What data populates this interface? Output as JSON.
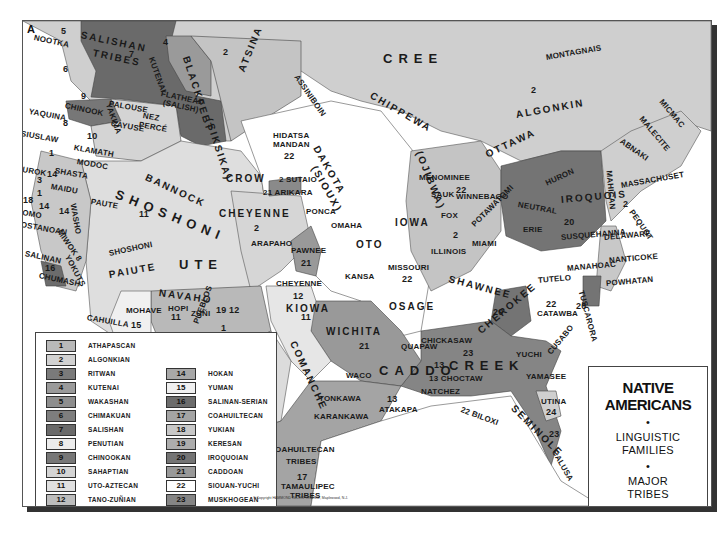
{
  "map": {
    "corner_label": "A",
    "title": {
      "line1": "NATIVE",
      "line2": "AMERICANS",
      "bullet": "•",
      "line3": "LINGUISTIC",
      "line4": "FAMILIES",
      "line5": "MAJOR",
      "line6": "TRIBES"
    },
    "copyright": "© Copyright HAMMOND INCORPORATED, Maplewood, N.J.",
    "colors": {
      "light": "#d6d6d6",
      "mid": "#b4b4b4",
      "dark": "#8c8c8c",
      "darker": "#6e6e6e",
      "white": "#ffffff",
      "border": "#444444"
    }
  },
  "legend": {
    "families": [
      {
        "num": "1",
        "name": "ATHAPASCAN",
        "color": "#b9b9b9"
      },
      {
        "num": "2",
        "name": "ALGONKIAN",
        "color": "#d2d2d2"
      },
      {
        "num": "3",
        "name": "RITWAN",
        "color": "#7a7a7a"
      },
      {
        "num": "4",
        "name": "KUTENAI",
        "color": "#9a9a9a"
      },
      {
        "num": "5",
        "name": "WAKASHAN",
        "color": "#8e8e8e"
      },
      {
        "num": "6",
        "name": "CHIMAKUAN",
        "color": "#7e7e7e"
      },
      {
        "num": "7",
        "name": "SALISHAN",
        "color": "#6a6a6a"
      },
      {
        "num": "8",
        "name": "PENUTIAN",
        "color": "#ececec"
      },
      {
        "num": "9",
        "name": "CHINOOKAN",
        "color": "#777777"
      },
      {
        "num": "10",
        "name": "SAHAPTIAN",
        "color": "#d4d4d4"
      },
      {
        "num": "11",
        "name": "UTO-AZTECAN",
        "color": "#e0e0e0"
      },
      {
        "num": "12",
        "name": "TANO-ZUÑIAN",
        "color": "#bdbdbd"
      },
      {
        "num": "13",
        "name": "TUNICAN",
        "color": "#a0a0a0"
      },
      {
        "num": "14",
        "name": "HOKAN",
        "color": "#a8a8a8"
      },
      {
        "num": "15",
        "name": "YUMAN",
        "color": "#f0f0f0"
      },
      {
        "num": "16",
        "name": "SALINAN-SERIAN",
        "color": "#6c6c6c"
      },
      {
        "num": "17",
        "name": "COAHUILTECAN",
        "color": "#a4a4a4"
      },
      {
        "num": "18",
        "name": "YUKIAN",
        "color": "#c8c8c8"
      },
      {
        "num": "19",
        "name": "KERESAN",
        "color": "#adadad"
      },
      {
        "num": "20",
        "name": "IROQUOIAN",
        "color": "#747474"
      },
      {
        "num": "21",
        "name": "CADDOAN",
        "color": "#999999"
      },
      {
        "num": "22",
        "name": "SIOUAN-YUCHI",
        "color": "#ffffff"
      },
      {
        "num": "23",
        "name": "MUSKHOGEAN",
        "color": "#858585"
      },
      {
        "num": "24",
        "name": "TIMUCUAN",
        "color": "#cfcfcf"
      }
    ]
  },
  "labels": [
    {
      "text": "SALISHAN",
      "x": 80,
      "y": 28,
      "cls": "med",
      "rot": 12
    },
    {
      "text": "TRIBES",
      "x": 92,
      "y": 46,
      "cls": "med",
      "rot": 12
    },
    {
      "text": "7",
      "x": 128,
      "y": 48,
      "cls": "num",
      "rot": 0
    },
    {
      "text": "5",
      "x": 60,
      "y": 25,
      "cls": "num",
      "rot": 0
    },
    {
      "text": "NOOTKA",
      "x": 33,
      "y": 32,
      "cls": "",
      "rot": 12
    },
    {
      "text": "6",
      "x": 62,
      "y": 63,
      "cls": "num",
      "rot": 0
    },
    {
      "text": "KUTENAI",
      "x": 150,
      "y": 52,
      "cls": "",
      "rot": 70
    },
    {
      "text": "4",
      "x": 162,
      "y": 36,
      "cls": "num",
      "rot": 0
    },
    {
      "text": "BLACKFEET",
      "x": 185,
      "y": 50,
      "cls": "med",
      "rot": 72
    },
    {
      "text": "(SIKSIKA)",
      "x": 208,
      "y": 112,
      "cls": "med",
      "rot": 72
    },
    {
      "text": "2",
      "x": 222,
      "y": 46,
      "cls": "num",
      "rot": 0
    },
    {
      "text": "ATSINA",
      "x": 240,
      "y": 65,
      "cls": "med",
      "rot": -68
    },
    {
      "text": "ASSINIBOIN",
      "x": 295,
      "y": 70,
      "cls": "",
      "rot": 55
    },
    {
      "text": "FLATHEAD",
      "x": 160,
      "y": 88,
      "cls": "",
      "rot": 12
    },
    {
      "text": "(SALISH)",
      "x": 162,
      "y": 97,
      "cls": "",
      "rot": 12
    },
    {
      "text": "9",
      "x": 80,
      "y": 90,
      "cls": "num",
      "rot": 0
    },
    {
      "text": "CHINOOK",
      "x": 64,
      "y": 100,
      "cls": "",
      "rot": 12
    },
    {
      "text": "YAKIMA",
      "x": 107,
      "y": 98,
      "cls": "",
      "rot": 70
    },
    {
      "text": "PALOUSE",
      "x": 108,
      "y": 98,
      "cls": "",
      "rot": 10
    },
    {
      "text": "NEZ",
      "x": 142,
      "y": 110,
      "cls": "",
      "rot": 10
    },
    {
      "text": "PERCÉ",
      "x": 138,
      "y": 119,
      "cls": "",
      "rot": 10
    },
    {
      "text": "CAYUSE",
      "x": 110,
      "y": 118,
      "cls": "",
      "rot": 10
    },
    {
      "text": "YAQUINA",
      "x": 28,
      "y": 106,
      "cls": "",
      "rot": 10
    },
    {
      "text": "8",
      "x": 62,
      "y": 117,
      "cls": "num",
      "rot": 0
    },
    {
      "text": "SIUSLAW",
      "x": 20,
      "y": 128,
      "cls": "",
      "rot": 10
    },
    {
      "text": "10",
      "x": 86,
      "y": 130,
      "cls": "num",
      "rot": 0
    },
    {
      "text": "KLAMATH",
      "x": 73,
      "y": 142,
      "cls": "",
      "rot": 10
    },
    {
      "text": "MODOC",
      "x": 76,
      "y": 156,
      "cls": "",
      "rot": 10
    },
    {
      "text": "1",
      "x": 48,
      "y": 147,
      "cls": "num",
      "rot": 0
    },
    {
      "text": "YUROK",
      "x": 16,
      "y": 163,
      "cls": "",
      "rot": 10
    },
    {
      "text": "14",
      "x": 46,
      "y": 168,
      "cls": "num",
      "rot": 0
    },
    {
      "text": "SHASTA",
      "x": 54,
      "y": 165,
      "cls": "",
      "rot": 10
    },
    {
      "text": "3",
      "x": 36,
      "y": 174,
      "cls": "num",
      "rot": 0
    },
    {
      "text": "MAIDU",
      "x": 50,
      "y": 181,
      "cls": "",
      "rot": 10
    },
    {
      "text": "1",
      "x": 36,
      "y": 187,
      "cls": "num",
      "rot": 0
    },
    {
      "text": "18",
      "x": 22,
      "y": 194,
      "cls": "num",
      "rot": 0
    },
    {
      "text": "14",
      "x": 38,
      "y": 200,
      "cls": "num",
      "rot": 0
    },
    {
      "text": "POMO",
      "x": 16,
      "y": 206,
      "cls": "",
      "rot": 10
    },
    {
      "text": "COSTANOAN",
      "x": 14,
      "y": 218,
      "cls": "",
      "rot": 10
    },
    {
      "text": "WASHO",
      "x": 72,
      "y": 198,
      "cls": "",
      "rot": 80
    },
    {
      "text": "14",
      "x": 58,
      "y": 205,
      "cls": "num",
      "rot": 0
    },
    {
      "text": "MIWOK 8",
      "x": 58,
      "y": 225,
      "cls": "",
      "rot": 55
    },
    {
      "text": "YOKUTS",
      "x": 66,
      "y": 250,
      "cls": "",
      "rot": 62
    },
    {
      "text": "SALINAN",
      "x": 24,
      "y": 248,
      "cls": "",
      "rot": 12
    },
    {
      "text": "16",
      "x": 44,
      "y": 262,
      "cls": "num",
      "rot": 0
    },
    {
      "text": "CHUMASH",
      "x": 38,
      "y": 270,
      "cls": "",
      "rot": 12
    },
    {
      "text": "BANNOCK",
      "x": 145,
      "y": 170,
      "cls": "med",
      "rot": 25
    },
    {
      "text": "SHOSHONI",
      "x": 115,
      "y": 185,
      "cls": "big",
      "rot": 22
    },
    {
      "text": "PAUTE",
      "x": 90,
      "y": 196,
      "cls": "",
      "rot": 10
    },
    {
      "text": "11",
      "x": 138,
      "y": 208,
      "cls": "num",
      "rot": 0
    },
    {
      "text": "CROW",
      "x": 225,
      "y": 172,
      "cls": "med",
      "rot": 0
    },
    {
      "text": "CHEYENNE",
      "x": 218,
      "y": 207,
      "cls": "med",
      "rot": 0
    },
    {
      "text": "2",
      "x": 253,
      "y": 222,
      "cls": "num",
      "rot": 0
    },
    {
      "text": "ARAPAHO",
      "x": 250,
      "y": 238,
      "cls": "",
      "rot": 0
    },
    {
      "text": "SHOSHONI",
      "x": 108,
      "y": 248,
      "cls": "",
      "rot": -12
    },
    {
      "text": "UTE",
      "x": 178,
      "y": 256,
      "cls": "big",
      "rot": 0
    },
    {
      "text": "PAIUTE",
      "x": 108,
      "y": 268,
      "cls": "med",
      "rot": -10
    },
    {
      "text": "HIDATSA",
      "x": 272,
      "y": 130,
      "cls": "",
      "rot": 0
    },
    {
      "text": "MANDAN",
      "x": 272,
      "y": 139,
      "cls": "",
      "rot": 0
    },
    {
      "text": "22",
      "x": 283,
      "y": 150,
      "cls": "num",
      "rot": 0
    },
    {
      "text": "DAKOTA",
      "x": 315,
      "y": 140,
      "cls": "med",
      "rot": 60
    },
    {
      "text": "(SIOUX)",
      "x": 313,
      "y": 160,
      "cls": "med",
      "rot": 60
    },
    {
      "text": "2 SUTAIO",
      "x": 278,
      "y": 174,
      "cls": "",
      "rot": 0
    },
    {
      "text": "21 ARIKARA",
      "x": 262,
      "y": 187,
      "cls": "",
      "rot": 0
    },
    {
      "text": "CREE",
      "x": 382,
      "y": 50,
      "cls": "big",
      "rot": 0
    },
    {
      "text": "CHIPPEWA",
      "x": 370,
      "y": 88,
      "cls": "med",
      "rot": 30
    },
    {
      "text": "(OJIBWA)",
      "x": 418,
      "y": 145,
      "cls": "med",
      "rot": 68
    },
    {
      "text": "MONTAGNAIS",
      "x": 545,
      "y": 52,
      "cls": "",
      "rot": -10
    },
    {
      "text": "2",
      "x": 530,
      "y": 84,
      "cls": "num",
      "rot": 0
    },
    {
      "text": "ALGONKIN",
      "x": 515,
      "y": 108,
      "cls": "med",
      "rot": -10
    },
    {
      "text": "OTTAWA",
      "x": 485,
      "y": 148,
      "cls": "med",
      "rot": -25
    },
    {
      "text": "MICMAC",
      "x": 660,
      "y": 95,
      "cls": "",
      "rot": 50
    },
    {
      "text": "MALECITE",
      "x": 640,
      "y": 112,
      "cls": "",
      "rot": 50
    },
    {
      "text": "ABNAKI",
      "x": 620,
      "y": 135,
      "cls": "",
      "rot": 35
    },
    {
      "text": "MAHICAN",
      "x": 608,
      "y": 165,
      "cls": "",
      "rot": 85
    },
    {
      "text": "MASSACHUSET",
      "x": 620,
      "y": 180,
      "cls": "",
      "rot": -10
    },
    {
      "text": "2",
      "x": 622,
      "y": 198,
      "cls": "num",
      "rot": 0
    },
    {
      "text": "PEQUOT",
      "x": 630,
      "y": 205,
      "cls": "",
      "rot": 55
    },
    {
      "text": "MENOMINEE",
      "x": 418,
      "y": 172,
      "cls": "",
      "rot": 0
    },
    {
      "text": "SAUK",
      "x": 430,
      "y": 189,
      "cls": "",
      "rot": 0
    },
    {
      "text": "22",
      "x": 455,
      "y": 184,
      "cls": "num",
      "rot": 0
    },
    {
      "text": "WINNEBAGO",
      "x": 455,
      "y": 191,
      "cls": "",
      "rot": 0
    },
    {
      "text": "HURON",
      "x": 545,
      "y": 178,
      "cls": "",
      "rot": -25
    },
    {
      "text": "IROQUOIS",
      "x": 560,
      "y": 193,
      "cls": "med",
      "rot": -5
    },
    {
      "text": "NEUTRAL",
      "x": 517,
      "y": 199,
      "cls": "",
      "rot": 10
    },
    {
      "text": "POTAWATOMI",
      "x": 472,
      "y": 220,
      "cls": "",
      "rot": -45
    },
    {
      "text": "FOX",
      "x": 440,
      "y": 210,
      "cls": "",
      "rot": 0
    },
    {
      "text": "IOWA",
      "x": 394,
      "y": 216,
      "cls": "med",
      "rot": 0
    },
    {
      "text": "2",
      "x": 452,
      "y": 229,
      "cls": "num",
      "rot": 0
    },
    {
      "text": "20",
      "x": 563,
      "y": 216,
      "cls": "num",
      "rot": 0
    },
    {
      "text": "ERIE",
      "x": 522,
      "y": 224,
      "cls": "",
      "rot": 0
    },
    {
      "text": "SUSQUEHANNA",
      "x": 560,
      "y": 232,
      "cls": "",
      "rot": -5
    },
    {
      "text": "DELAWARE",
      "x": 603,
      "y": 232,
      "cls": "",
      "rot": -5
    },
    {
      "text": "PONCA",
      "x": 305,
      "y": 206,
      "cls": "",
      "rot": 0
    },
    {
      "text": "OMAHA",
      "x": 330,
      "y": 220,
      "cls": "",
      "rot": 0
    },
    {
      "text": "OTO",
      "x": 355,
      "y": 238,
      "cls": "med",
      "rot": 0
    },
    {
      "text": "ILLINOIS",
      "x": 430,
      "y": 246,
      "cls": "",
      "rot": 0
    },
    {
      "text": "MIAMI",
      "x": 471,
      "y": 238,
      "cls": "",
      "rot": 0
    },
    {
      "text": "PAWNEE",
      "x": 290,
      "y": 245,
      "cls": "",
      "rot": 0
    },
    {
      "text": "21",
      "x": 300,
      "y": 257,
      "cls": "num",
      "rot": 0
    },
    {
      "text": "MISSOURI",
      "x": 387,
      "y": 262,
      "cls": "",
      "rot": 0
    },
    {
      "text": "22",
      "x": 401,
      "y": 273,
      "cls": "num",
      "rot": 0
    },
    {
      "text": "KANSA",
      "x": 344,
      "y": 271,
      "cls": "",
      "rot": 0
    },
    {
      "text": "SHAWNEE",
      "x": 448,
      "y": 272,
      "cls": "med",
      "rot": 15
    },
    {
      "text": "MANAHOAC",
      "x": 566,
      "y": 263,
      "cls": "",
      "rot": -5
    },
    {
      "text": "TUTELO",
      "x": 537,
      "y": 275,
      "cls": "",
      "rot": -5
    },
    {
      "text": "NANTICOKE",
      "x": 608,
      "y": 255,
      "cls": "",
      "rot": -5
    },
    {
      "text": "POWHATAN",
      "x": 605,
      "y": 278,
      "cls": "",
      "rot": -5
    },
    {
      "text": "TUSCARORA",
      "x": 580,
      "y": 285,
      "cls": "",
      "rot": 75
    },
    {
      "text": "20",
      "x": 575,
      "y": 300,
      "cls": "num",
      "rot": 0
    },
    {
      "text": "22",
      "x": 545,
      "y": 298,
      "cls": "num",
      "rot": 0
    },
    {
      "text": "CATAWBA",
      "x": 536,
      "y": 308,
      "cls": "",
      "rot": 0
    },
    {
      "text": "CHEYENNE",
      "x": 275,
      "y": 278,
      "cls": "",
      "rot": 0
    },
    {
      "text": "12",
      "x": 292,
      "y": 290,
      "cls": "num",
      "rot": 0
    },
    {
      "text": "KIOWA",
      "x": 285,
      "y": 302,
      "cls": "med",
      "rot": 0
    },
    {
      "text": "OSAGE",
      "x": 388,
      "y": 300,
      "cls": "med",
      "rot": 0
    },
    {
      "text": "20",
      "x": 492,
      "y": 306,
      "cls": "num",
      "rot": 0
    },
    {
      "text": "CHEROKEE",
      "x": 478,
      "y": 325,
      "cls": "med",
      "rot": -40
    },
    {
      "text": "NAVAHO",
      "x": 158,
      "y": 286,
      "cls": "med",
      "rot": 8
    },
    {
      "text": "HOPI",
      "x": 167,
      "y": 303,
      "cls": "",
      "rot": 0
    },
    {
      "text": "11",
      "x": 170,
      "y": 311,
      "cls": "num",
      "rot": 0
    },
    {
      "text": "ZUÑI",
      "x": 190,
      "y": 308,
      "cls": "",
      "rot": 0
    },
    {
      "text": "19 12",
      "x": 215,
      "y": 304,
      "cls": "num",
      "rot": 0
    },
    {
      "text": "MOHAVE",
      "x": 125,
      "y": 305,
      "cls": "",
      "rot": 0
    },
    {
      "text": "15",
      "x": 130,
      "y": 319,
      "cls": "num",
      "rot": 0
    },
    {
      "text": "CAHUILLA",
      "x": 86,
      "y": 312,
      "cls": "",
      "rot": 10
    },
    {
      "text": "YUMA",
      "x": 112,
      "y": 330,
      "cls": "med",
      "rot": 10
    },
    {
      "text": "DIEGUEÑO",
      "x": 58,
      "y": 337,
      "cls": "",
      "rot": 10
    },
    {
      "text": "PAPAGO",
      "x": 140,
      "y": 348,
      "cls": "",
      "rot": -10
    },
    {
      "text": "PIMA",
      "x": 148,
      "y": 362,
      "cls": "",
      "rot": 10
    },
    {
      "text": "APACHE",
      "x": 158,
      "y": 328,
      "cls": "big",
      "rot": 25
    },
    {
      "text": "PUEBLOS",
      "x": 195,
      "y": 318,
      "cls": "",
      "rot": -70
    },
    {
      "text": "1",
      "x": 220,
      "y": 322,
      "cls": "num",
      "rot": 0
    },
    {
      "text": "11",
      "x": 300,
      "y": 311,
      "cls": "num",
      "rot": 0
    },
    {
      "text": "COMANCHE",
      "x": 292,
      "y": 335,
      "cls": "med",
      "rot": 65
    },
    {
      "text": "WICHITA",
      "x": 325,
      "y": 325,
      "cls": "med",
      "rot": 0
    },
    {
      "text": "21",
      "x": 358,
      "y": 340,
      "cls": "num",
      "rot": 0
    },
    {
      "text": "QUAPAW",
      "x": 400,
      "y": 341,
      "cls": "",
      "rot": 0
    },
    {
      "text": "CADDO",
      "x": 378,
      "y": 362,
      "cls": "big",
      "rot": 0
    },
    {
      "text": "WACO",
      "x": 345,
      "y": 370,
      "cls": "",
      "rot": 0
    },
    {
      "text": "CHICKASAW",
      "x": 420,
      "y": 335,
      "cls": "",
      "rot": 0
    },
    {
      "text": "23",
      "x": 462,
      "y": 347,
      "cls": "num",
      "rot": 0
    },
    {
      "text": "CREEK",
      "x": 448,
      "y": 357,
      "cls": "big",
      "rot": 0
    },
    {
      "text": "YUCHI",
      "x": 515,
      "y": 349,
      "cls": "",
      "rot": 0
    },
    {
      "text": "CUSABO",
      "x": 548,
      "y": 348,
      "cls": "",
      "rot": -50
    },
    {
      "text": "13",
      "x": 433,
      "y": 359,
      "cls": "num",
      "rot": 0
    },
    {
      "text": "13 CHOCTAW",
      "x": 428,
      "y": 373,
      "cls": "",
      "rot": 0
    },
    {
      "text": "NATCHEZ",
      "x": 420,
      "y": 386,
      "cls": "",
      "rot": 0
    },
    {
      "text": "YAMASEE",
      "x": 525,
      "y": 371,
      "cls": "",
      "rot": 0
    },
    {
      "text": "22 BILOXI",
      "x": 460,
      "y": 404,
      "cls": "",
      "rot": 20
    },
    {
      "text": "SEMINOLE",
      "x": 512,
      "y": 400,
      "cls": "med",
      "rot": 45
    },
    {
      "text": "UTINA",
      "x": 540,
      "y": 396,
      "cls": "",
      "rot": 0
    },
    {
      "text": "24",
      "x": 545,
      "y": 406,
      "cls": "num",
      "rot": 0
    },
    {
      "text": "23",
      "x": 548,
      "y": 428,
      "cls": "num",
      "rot": 0
    },
    {
      "text": "CALUSA",
      "x": 553,
      "y": 445,
      "cls": "",
      "rot": 60
    },
    {
      "text": "TONKAWA",
      "x": 318,
      "y": 393,
      "cls": "",
      "rot": 0
    },
    {
      "text": "KARANKAWA",
      "x": 313,
      "y": 411,
      "cls": "",
      "rot": 0
    },
    {
      "text": "13",
      "x": 386,
      "y": 393,
      "cls": "num",
      "rot": 0
    },
    {
      "text": "ATAKAPA",
      "x": 378,
      "y": 404,
      "cls": "",
      "rot": 0
    },
    {
      "text": "CONCHO",
      "x": 215,
      "y": 417,
      "cls": "",
      "rot": 0
    },
    {
      "text": "11",
      "x": 226,
      "y": 437,
      "cls": "num",
      "rot": 0
    },
    {
      "text": "LAGUNERO",
      "x": 213,
      "y": 456,
      "cls": "",
      "rot": 0
    },
    {
      "text": "COAHUILTECAN",
      "x": 268,
      "y": 444,
      "cls": "",
      "rot": 0
    },
    {
      "text": "TRIBES",
      "x": 285,
      "y": 456,
      "cls": "",
      "rot": 0
    },
    {
      "text": "17",
      "x": 296,
      "y": 471,
      "cls": "num",
      "rot": 0
    },
    {
      "text": "TAMAULIPEC",
      "x": 280,
      "y": 481,
      "cls": "",
      "rot": 0
    },
    {
      "text": "TRIBES",
      "x": 289,
      "y": 490,
      "cls": "",
      "rot": 0
    }
  ]
}
